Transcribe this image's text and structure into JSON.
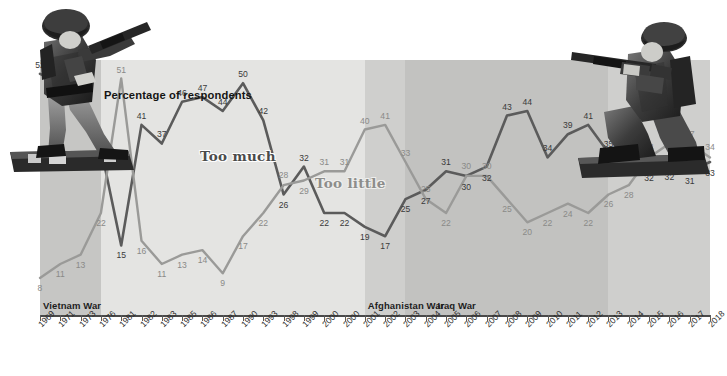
{
  "title": "Percentage of respondents",
  "series_labels": {
    "too_much": "Too much",
    "too_little": "Too little"
  },
  "colors": {
    "too_much": "#5b5b5b",
    "too_little": "#9a9a98",
    "plot_bg": "#e4e4e2",
    "band_vietnam": "#c6c6c4",
    "band_afghanistan": "#cfcfcd",
    "band_iraq": "#c2c2c0",
    "axis": "#4a4a4a"
  },
  "war_bands": [
    {
      "name": "Vietnam War",
      "label": "Vietnam War"
    },
    {
      "name": "Afghanistan War",
      "label": "Afghanistan War"
    },
    {
      "name": "Iraq War",
      "label": "Iraq War"
    }
  ],
  "icons": {
    "soldier_left": "toy-soldier-standing-icon",
    "soldier_right": "toy-soldier-kneeling-icon"
  },
  "chart_data": {
    "type": "line",
    "title": "Percentage of respondents",
    "xlabel": "",
    "ylabel": "Percentage of respondents",
    "ylim": [
      0,
      55
    ],
    "grid": false,
    "legend": "inline-series-labels",
    "categories": [
      "1969",
      "1971",
      "1973",
      "1976",
      "1981",
      "1982",
      "1983",
      "1985",
      "1986",
      "1987",
      "1990",
      "1993",
      "1998",
      "1999",
      "2000",
      "2000",
      "2001",
      "2002",
      "2003",
      "2004",
      "2005",
      "2006",
      "2007",
      "2008",
      "2009",
      "2010",
      "2011",
      "2012",
      "2013",
      "2014",
      "2015",
      "2016",
      "2017",
      "2018"
    ],
    "series": [
      {
        "name": "Too much",
        "color": "#5b5b5b",
        "values": [
          52,
          50,
          46,
          36,
          15,
          41,
          37,
          46,
          47,
          44,
          50,
          42,
          26,
          32,
          22,
          22,
          19,
          17,
          25,
          27,
          31,
          30,
          32,
          43,
          44,
          34,
          39,
          41,
          35,
          37,
          32,
          32,
          31,
          33
        ]
      },
      {
        "name": "Too little",
        "color": "#9a9a98",
        "values": [
          8,
          11,
          13,
          22,
          51,
          16,
          11,
          13,
          14,
          9,
          17,
          22,
          28,
          29,
          31,
          31,
          40,
          41,
          33,
          25,
          22,
          30,
          30,
          25,
          20,
          22,
          24,
          22,
          26,
          28,
          34,
          37,
          37,
          34
        ]
      }
    ],
    "annotations": [
      {
        "text": "Vietnam War",
        "span": [
          "1969",
          "1976"
        ]
      },
      {
        "text": "Afghanistan War",
        "span": [
          "2001",
          "2018"
        ]
      },
      {
        "text": "Iraq War",
        "span": [
          "2003",
          "2013"
        ]
      }
    ]
  }
}
